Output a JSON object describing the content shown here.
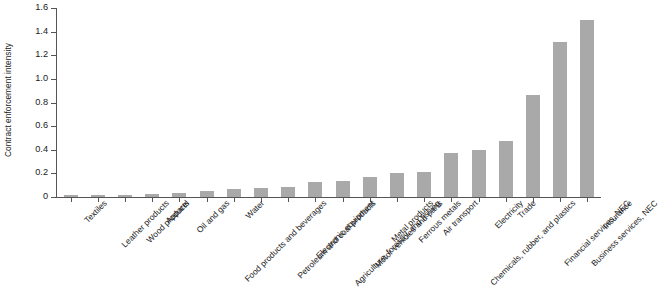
{
  "chart_data": {
    "type": "bar",
    "title": "",
    "xlabel": "",
    "ylabel": "Contract enforcement intensity",
    "ylim": [
      0,
      1.6
    ],
    "ytick_labels": [
      "0",
      "0.2",
      "0.4",
      "0.6",
      "0.8",
      "1.0",
      "1.2",
      "1.4",
      "1.6"
    ],
    "ytick_values": [
      0,
      0.2,
      0.4,
      0.6,
      0.8,
      1.0,
      1.2,
      1.4,
      1.6
    ],
    "grid": false,
    "legend": "none",
    "bar_color": "#a9a9a9",
    "axis_color": "#545454",
    "categories": [
      "Textiles",
      "Leather products",
      "Wood products",
      "Apparel",
      "Oil and gas",
      "Food products and beverages",
      "Water",
      "Petroleum and coal products",
      "Electronic equipment",
      "Agriculture, forestry, and fishing",
      "Motor vehicles and parts",
      "Metal products",
      "Ferrous metals",
      "Air transport",
      "Chemicals, rubber, and plastics",
      "Electricity",
      "Trade",
      "Financial services, NEC",
      "Business services, NEC",
      "Insurance"
    ],
    "values": [
      0.015,
      0.015,
      0.02,
      0.025,
      0.03,
      0.05,
      0.07,
      0.08,
      0.085,
      0.13,
      0.135,
      0.17,
      0.2,
      0.21,
      0.37,
      0.4,
      0.47,
      0.86,
      1.31,
      1.5
    ]
  }
}
